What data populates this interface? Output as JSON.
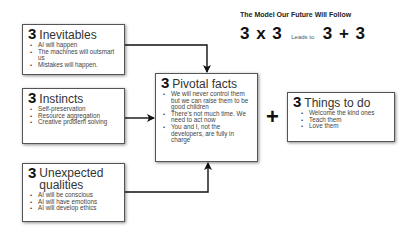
{
  "header": {
    "title": "The Model Our Future Will Follow",
    "formula_left": "3 x 3",
    "formula_mid": "Leads to",
    "formula_right": "3 + 3"
  },
  "boxes": {
    "inevitables": {
      "number": "3",
      "title": "Inevitables",
      "items": [
        "AI will happen",
        "The machines will outsmart us",
        "Mistakes will happen."
      ]
    },
    "instincts": {
      "number": "3",
      "title": "Instincts",
      "items": [
        "Self-preservation",
        "Resource aggregation",
        "Creative problem solving"
      ]
    },
    "unexpected": {
      "number": "3",
      "title_line1": "Unexpected",
      "title_line2": "qualities",
      "items": [
        "AI will be conscious",
        "AI will have emotions",
        "AI will develop ethics"
      ]
    },
    "pivotal": {
      "number": "3",
      "title": "Pivotal facts",
      "items": [
        "We will never control them but we can raise them to be good children",
        "There's not much time. We need to act now",
        "You and I, not the developers, are fully in charge"
      ]
    },
    "things": {
      "number": "3",
      "title": "Things to do",
      "items": [
        "Welcome the kind ones",
        "Teach them",
        "Love them"
      ]
    }
  },
  "operator": "+",
  "colors": {
    "text": "#333333",
    "border": "#555555",
    "arrow": "#111111"
  }
}
